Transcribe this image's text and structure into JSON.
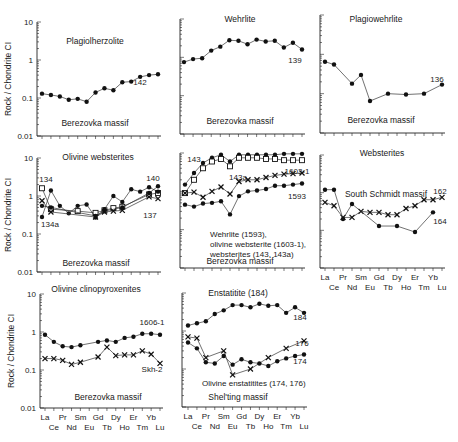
{
  "figure": {
    "y_axis_label": "Rock / Chondrite CI",
    "y_ticks": [
      "10",
      "1",
      "0.1",
      "0.01"
    ],
    "x_ticks_top": [
      "La",
      "Pr",
      "Sm",
      "Gd",
      "Dy",
      "Er",
      "Yb"
    ],
    "x_ticks_bottom": [
      "Ce",
      "Nd",
      "Eu",
      "Tb",
      "Ho",
      "Tm",
      "Lu"
    ]
  },
  "chart_data": [
    {
      "type": "line",
      "title": "Plagiolherzolite",
      "subtitle": "Berezovka massif",
      "xlabel": "",
      "ylabel": "Rock / Chondrite CI",
      "yscale": "log",
      "ylim": [
        0.01,
        10
      ],
      "categories": [
        "La",
        "Ce",
        "Pr",
        "Nd",
        "Sm",
        "Eu",
        "Gd",
        "Tb",
        "Dy",
        "Ho",
        "Er",
        "Tm",
        "Yb",
        "Lu"
      ],
      "series": [
        {
          "name": "142",
          "marker": "dot",
          "values": [
            0.13,
            0.12,
            0.11,
            0.09,
            0.095,
            0.08,
            0.14,
            0.18,
            0.16,
            0.26,
            0.27,
            0.36,
            0.4,
            0.42
          ]
        }
      ]
    },
    {
      "type": "line",
      "title": "Wehrlite",
      "subtitle": "Berezovka massif",
      "xlabel": "",
      "ylabel": "",
      "yscale": "log",
      "ylim": [
        0.01,
        10
      ],
      "categories": [
        "La",
        "Ce",
        "Pr",
        "Nd",
        "Sm",
        "Eu",
        "Gd",
        "Tb",
        "Dy",
        "Ho",
        "Er",
        "Tm",
        "Yb",
        "Lu"
      ],
      "series": [
        {
          "name": "139",
          "marker": "dot",
          "values": [
            0.75,
            0.9,
            0.95,
            1.5,
            1.9,
            2.8,
            2.7,
            2.2,
            2.9,
            2.6,
            2.7,
            1.8,
            2.4,
            1.6
          ]
        }
      ]
    },
    {
      "type": "line",
      "title": "Plagiowehrlite",
      "subtitle": "Berezovka massif",
      "xlabel": "",
      "ylabel": "",
      "yscale": "log",
      "ylim": [
        0.01,
        10
      ],
      "categories": [
        "La",
        "Ce",
        "Pr",
        "Nd",
        "Sm",
        "Eu",
        "Gd",
        "Tb",
        "Dy",
        "Ho",
        "Er",
        "Tm",
        "Yb",
        "Lu"
      ],
      "series": [
        {
          "name": "136",
          "marker": "dot",
          "values": [
            0.65,
            0.55,
            null,
            0.18,
            0.3,
            0.065,
            null,
            0.1,
            null,
            0.095,
            null,
            0.1,
            null,
            0.17
          ]
        }
      ]
    },
    {
      "type": "line",
      "title": "Olivine websterites",
      "subtitle": "Berezovka massif",
      "xlabel": "",
      "ylabel": "Rock / Chondrite CI",
      "yscale": "log",
      "ylim": [
        0.01,
        10
      ],
      "categories": [
        "La",
        "Ce",
        "Pr",
        "Nd",
        "Sm",
        "Eu",
        "Gd",
        "Tb",
        "Dy",
        "Ho",
        "Er",
        "Tm",
        "Yb",
        "Lu"
      ],
      "series": [
        {
          "name": "134",
          "marker": "square",
          "values": [
            1.6,
            0.45,
            null,
            null,
            0.4,
            null,
            0.36,
            0.42,
            0.48,
            0.52,
            null,
            null,
            1.1,
            1.2
          ]
        },
        {
          "name": "134a",
          "marker": "dot",
          "values": [
            0.28,
            1.4,
            0.55,
            0.35,
            0.55,
            0.6,
            0.27,
            0.45,
            1.0,
            0.7,
            1.5,
            1.3,
            1.7,
            1.3
          ]
        },
        {
          "name": "140",
          "marker": "dot",
          "values": [
            0.55,
            0.5,
            null,
            null,
            null,
            null,
            0.3,
            0.4,
            null,
            0.5,
            null,
            null,
            1.2,
            1.8
          ]
        },
        {
          "name": "137",
          "marker": "cross",
          "values": [
            0.75,
            0.38,
            null,
            null,
            null,
            null,
            0.28,
            0.38,
            0.4,
            0.42,
            null,
            null,
            0.95,
            0.85
          ]
        }
      ]
    },
    {
      "type": "line",
      "title": "",
      "subtitle": "Berezovka massif",
      "annotation": [
        "Wehrlite (1593),",
        "olivine websterite (1603-1),",
        "websterites (143, 143a)"
      ],
      "xlabel": "",
      "ylabel": "",
      "yscale": "log",
      "ylim": [
        0.01,
        10
      ],
      "categories": [
        "La",
        "Ce",
        "Pr",
        "Nd",
        "Sm",
        "Eu",
        "Gd",
        "Tb",
        "Dy",
        "Ho",
        "Er",
        "Tm",
        "Yb",
        "Lu"
      ],
      "series": [
        {
          "name": "143",
          "marker": "dot",
          "values": [
            1.5,
            3.0,
            5.5,
            7.5,
            9.0,
            6.0,
            9.0,
            9.0,
            9.0,
            9.0,
            9.0,
            9.5,
            9.5,
            9.5
          ]
        },
        {
          "name": "143a",
          "marker": "square",
          "values": [
            0.9,
            2.0,
            4.0,
            6.0,
            7.0,
            4.5,
            7.5,
            7.5,
            7.5,
            7.0,
            7.0,
            6.5,
            6.5,
            6.5
          ]
        },
        {
          "name": "1603-1",
          "marker": "cross",
          "values": [
            0.9,
            0.95,
            0.7,
            1.0,
            1.3,
            0.85,
            1.8,
            2.0,
            2.0,
            2.3,
            2.6,
            2.8,
            2.9,
            3.0
          ]
        },
        {
          "name": "1593",
          "marker": "dot",
          "values": [
            0.45,
            0.4,
            0.48,
            0.5,
            0.55,
            0.25,
            0.75,
            1.0,
            1.05,
            1.15,
            1.4,
            1.4,
            1.5,
            1.6
          ]
        }
      ]
    },
    {
      "type": "line",
      "title": "Websterites",
      "subtitle": "South Schmidt massif",
      "xlabel": "",
      "ylabel": "",
      "yscale": "log",
      "ylim": [
        0.01,
        10
      ],
      "categories": [
        "La",
        "Ce",
        "Pr",
        "Nd",
        "Sm",
        "Eu",
        "Gd",
        "Tb",
        "Dy",
        "Ho",
        "Er",
        "Tm",
        "Yb",
        "Lu"
      ],
      "series": [
        {
          "name": "162",
          "marker": "cross",
          "values": [
            0.55,
            0.45,
            0.22,
            0.22,
            0.32,
            0.3,
            0.3,
            0.26,
            0.26,
            0.38,
            0.45,
            0.65,
            0.65,
            0.75
          ]
        },
        {
          "name": "164",
          "marker": "dot",
          "values": [
            1.2,
            1.2,
            0.2,
            0.5,
            null,
            null,
            0.13,
            null,
            0.13,
            null,
            0.09,
            null,
            0.3,
            null
          ]
        }
      ]
    },
    {
      "type": "line",
      "title": "Olivine clinopyroxenites",
      "subtitle": "Berezovka massif",
      "xlabel": "",
      "ylabel": "Rock / Chondrite CI",
      "yscale": "log",
      "ylim": [
        0.01,
        10
      ],
      "categories": [
        "La",
        "Ce",
        "Pr",
        "Nd",
        "Sm",
        "Eu",
        "Gd",
        "Tb",
        "Dy",
        "Ho",
        "Er",
        "Tm",
        "Yb",
        "Lu"
      ],
      "series": [
        {
          "name": "1606-1",
          "marker": "dot",
          "values": [
            0.85,
            0.55,
            0.42,
            0.4,
            0.45,
            null,
            0.55,
            0.6,
            0.55,
            0.7,
            0.75,
            0.9,
            0.9,
            0.85
          ]
        },
        {
          "name": "Skh-2",
          "marker": "cross",
          "values": [
            0.2,
            0.2,
            0.18,
            0.14,
            0.16,
            null,
            0.22,
            0.4,
            0.24,
            0.25,
            0.25,
            0.32,
            0.26,
            0.15
          ]
        }
      ]
    },
    {
      "type": "line",
      "title": "Enstatitite (184)",
      "subtitle": "Shel'ting massif",
      "annotation": [
        "Olivine enstatitites (174, 176)"
      ],
      "xlabel": "",
      "ylabel": "",
      "yscale": "log",
      "ylim": [
        0.01,
        10
      ],
      "categories": [
        "La",
        "Ce",
        "Pr",
        "Nd",
        "Sm",
        "Eu",
        "Gd",
        "Tb",
        "Dy",
        "Ho",
        "Er",
        "Tm",
        "Yb",
        "Lu"
      ],
      "series": [
        {
          "name": "184",
          "marker": "dot",
          "values": [
            1.4,
            1.6,
            1.8,
            2.8,
            3.5,
            4.8,
            4.8,
            4.2,
            5.2,
            4.6,
            4.8,
            3.0,
            4.2,
            3.0
          ]
        },
        {
          "name": "176",
          "marker": "cross",
          "values": [
            0.7,
            0.65,
            0.2,
            null,
            0.3,
            0.07,
            null,
            0.1,
            null,
            0.2,
            null,
            0.35,
            null,
            0.55
          ]
        },
        {
          "name": "174",
          "marker": "dot",
          "values": [
            0.5,
            0.35,
            0.15,
            0.14,
            0.22,
            0.13,
            0.18,
            0.15,
            0.14,
            0.12,
            0.16,
            0.19,
            0.22,
            0.24
          ]
        }
      ]
    }
  ]
}
